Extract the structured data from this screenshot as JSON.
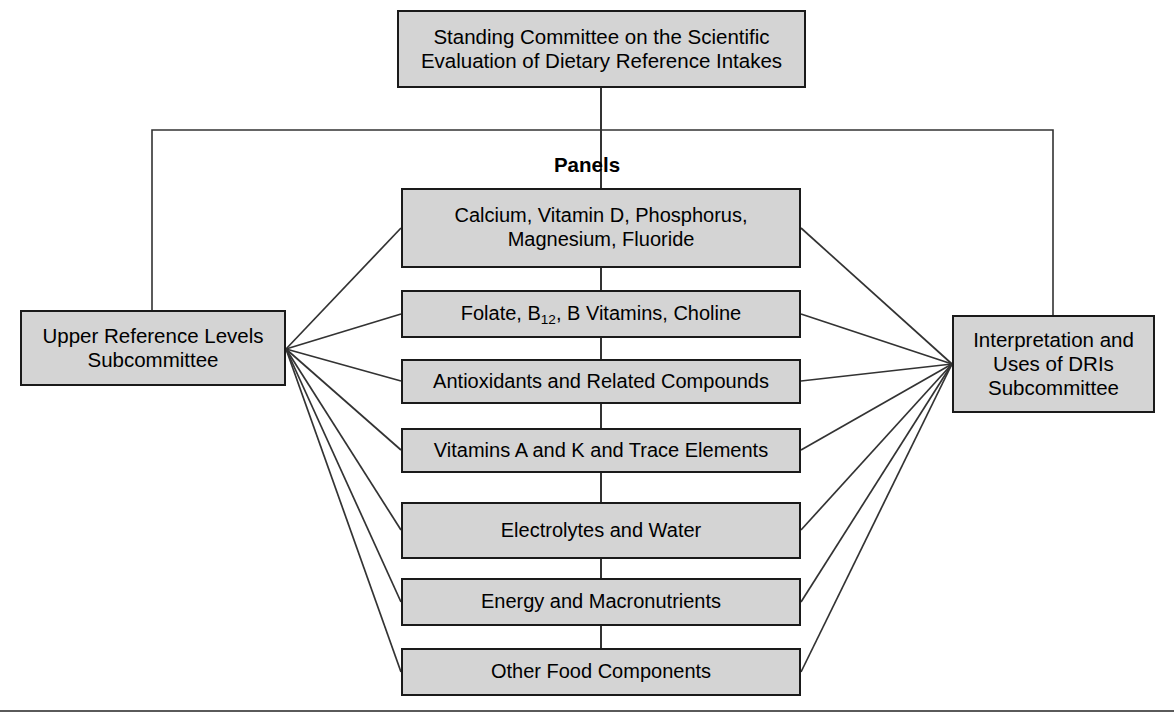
{
  "diagram": {
    "type": "organizational-hierarchy",
    "title_box": {
      "label": "Standing Committee on the Scientific\nEvaluation of Dietary Reference Intakes"
    },
    "panels_heading": "Panels",
    "left_subcommittee": {
      "label": "Upper Reference Levels\nSubcommittee"
    },
    "right_subcommittee": {
      "label": "Interpretation and\nUses of DRIs\nSubcommittee"
    },
    "panels": [
      {
        "label": "Calcium, Vitamin D, Phosphorus,\nMagnesium, Fluoride",
        "has_subscript": false
      },
      {
        "label": "Folate, B12, B Vitamins, Choline",
        "has_subscript": true,
        "prefix": "Folate, B",
        "subscript": "12",
        "suffix": ", B Vitamins, Choline"
      },
      {
        "label": "Antioxidants and Related Compounds",
        "has_subscript": false
      },
      {
        "label": "Vitamins A and K and Trace Elements",
        "has_subscript": false
      },
      {
        "label": "Electrolytes and Water",
        "has_subscript": false
      },
      {
        "label": "Energy and Macronutrients",
        "has_subscript": false
      },
      {
        "label": "Other Food Components",
        "has_subscript": false
      }
    ],
    "colors": {
      "box_fill": "#d4d4d4",
      "box_border": "#1a1a1a",
      "connector": "#333333",
      "background": "#ffffff",
      "rule": "#5a5a5a"
    }
  }
}
